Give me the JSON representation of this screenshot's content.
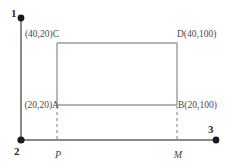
{
  "figure": {
    "type": "geometry-diagram",
    "colors": {
      "line": "#8a8a8a",
      "axis": "#8a8a8a",
      "dot": "#1a1a1a",
      "text": "#3a3a3a"
    }
  },
  "axes": {
    "vertical": {
      "label": "1",
      "label_name": "axis-1"
    },
    "origin": {
      "label": "2",
      "label_name": "axis-2"
    },
    "horizontal": {
      "label": "3",
      "label_name": "axis-3"
    }
  },
  "points": [
    {
      "id": "C",
      "name": "point-c",
      "label": "(40,20)C",
      "coords": "(40,20)",
      "letter": "C",
      "position": "top-left"
    },
    {
      "id": "D",
      "name": "point-d",
      "label": "D(40,100)",
      "coords": "(40,100)",
      "letter": "D",
      "position": "top-right"
    },
    {
      "id": "A",
      "name": "point-a",
      "label": "(20,20)A",
      "coords": "(20,20)",
      "letter": "A",
      "position": "bottom-left"
    },
    {
      "id": "B",
      "name": "point-b",
      "label": "B(20,100)",
      "coords": "(20,100)",
      "letter": "B",
      "position": "bottom-right"
    }
  ],
  "foot_points": [
    {
      "id": "P",
      "name": "foot-point-p",
      "label": "P"
    },
    {
      "id": "M",
      "name": "foot-point-m",
      "label": "M"
    }
  ]
}
